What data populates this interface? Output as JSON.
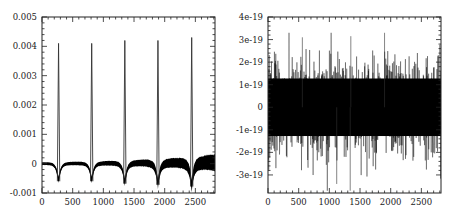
{
  "chart_data": [
    {
      "type": "line",
      "title": "",
      "xlabel": "",
      "ylabel": "",
      "xlim": [
        0,
        2820
      ],
      "ylim": [
        -0.001,
        0.005
      ],
      "grid": false,
      "legend": null,
      "x_ticks": [
        0,
        500,
        1000,
        1500,
        2000,
        2500
      ],
      "x_tick_labels": [
        "0",
        "500",
        "1000",
        "1500",
        "2000",
        "2500"
      ],
      "y_ticks": [
        -0.001,
        0,
        0.001,
        0.002,
        0.003,
        0.004,
        0.005
      ],
      "y_tick_labels": [
        "-0.001",
        "0",
        "0.001",
        "0.002",
        "0.003",
        "0.004",
        "0.005"
      ],
      "series": [
        {
          "name": "signal",
          "description": "Baseline near 0 with periodic sharp spikes; noise band grows with x; sharp negative dips flank each spike",
          "spikes": [
            {
              "x": 270,
              "peak": 0.0041,
              "trough": -0.0006
            },
            {
              "x": 810,
              "peak": 0.0041,
              "trough": -0.0006
            },
            {
              "x": 1350,
              "peak": 0.0042,
              "trough": -0.00068
            },
            {
              "x": 1890,
              "peak": 0.0042,
              "trough": -0.00072
            },
            {
              "x": 2440,
              "peak": 0.0043,
              "trough": -0.00078
            }
          ],
          "band_halfwidth": [
            {
              "x": 0,
              "value": 5e-05
            },
            {
              "x": 800,
              "value": 7e-05
            },
            {
              "x": 1400,
              "value": 0.0001
            },
            {
              "x": 1900,
              "value": 0.00015
            },
            {
              "x": 2400,
              "value": 0.0002
            },
            {
              "x": 2820,
              "value": 0.0003
            }
          ]
        }
      ]
    },
    {
      "type": "line",
      "title": "",
      "xlabel": "",
      "ylabel": "",
      "xlim": [
        0,
        2820
      ],
      "ylim": [
        -3.8e-19,
        4e-19
      ],
      "grid": false,
      "legend": null,
      "x_ticks": [
        0,
        500,
        1000,
        1500,
        2000,
        2500
      ],
      "x_tick_labels": [
        "0",
        "500",
        "1000",
        "1500",
        "2000",
        "2500"
      ],
      "y_ticks": [
        -3e-19,
        -2e-19,
        -1e-19,
        0,
        1e-19,
        2e-19,
        3e-19,
        4e-19
      ],
      "y_tick_labels": [
        "-3e-19",
        "-2e-19",
        "-1e-19",
        "0",
        "1e-19",
        "2e-19",
        "3e-19",
        "4e-19"
      ],
      "series": [
        {
          "name": "residual",
          "description": "Dense random noise centered at 0, dense band roughly ±1.7e-19 with spikes reaching ±3.3e-19",
          "core_amplitude": 1.7e-19,
          "max_positive": 3.3e-19,
          "max_negative": -3.7e-19
        }
      ]
    }
  ],
  "plots": {
    "left": {
      "frame": {
        "x0": 42,
        "y0": 17,
        "x1": 215,
        "y1": 193
      },
      "y_label_x": 37
    },
    "right": {
      "frame": {
        "x0": 268,
        "y0": 17,
        "x1": 441,
        "y1": 193
      },
      "y_label_x": 263
    }
  },
  "colors": {
    "line": "#000000",
    "spike": "#333333",
    "frame": "#222222",
    "background": "#ffffff"
  }
}
